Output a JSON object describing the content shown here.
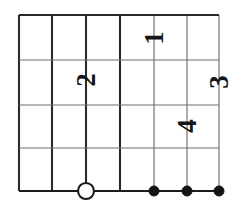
{
  "figure": {
    "background_color": "#ffffff",
    "width": 239,
    "height": 206,
    "ink_color": "#1c1c1c",
    "minor_line_color": "#6f6f6f"
  },
  "chart_data": {
    "type": "scatter",
    "title": "",
    "xlabel": "",
    "ylabel": "",
    "grid": true,
    "legend_position": "none",
    "orientation": "labels rotated 90 degrees counter-clockwise",
    "xlim": [
      19,
      219
    ],
    "ylim": [
      15,
      191
    ],
    "grid_vertical_x": [
      19,
      52,
      86,
      120,
      154,
      187,
      219
    ],
    "grid_horizontal_y": [
      15,
      60,
      105,
      148,
      191
    ],
    "vertical_line_weights": [
      "major",
      "major",
      "major",
      "major",
      "minor",
      "minor",
      "minor"
    ],
    "horizontal_line_weights": [
      "major",
      "minor",
      "minor",
      "minor",
      "major"
    ],
    "points": [
      {
        "id": "p0",
        "x": 86,
        "y": 191,
        "marker": "open-circle",
        "radius": 8,
        "label": ""
      },
      {
        "id": "p1",
        "x": 154,
        "y": 191,
        "marker": "filled-circle",
        "radius": 5,
        "label": ""
      },
      {
        "id": "p2",
        "x": 187,
        "y": 191,
        "marker": "filled-circle",
        "radius": 5,
        "label": ""
      },
      {
        "id": "p3",
        "x": 219,
        "y": 191,
        "marker": "filled-circle",
        "radius": 5,
        "label": ""
      }
    ],
    "annotations": [
      {
        "id": "a1",
        "text": "1",
        "x": 154,
        "y": 38,
        "rotation": -90
      },
      {
        "id": "a2",
        "text": "2",
        "x": 86,
        "y": 80,
        "rotation": -90
      },
      {
        "id": "a3",
        "text": "3",
        "x": 219,
        "y": 82,
        "rotation": -90
      },
      {
        "id": "a4",
        "text": "4",
        "x": 187,
        "y": 126,
        "rotation": -90
      }
    ]
  }
}
